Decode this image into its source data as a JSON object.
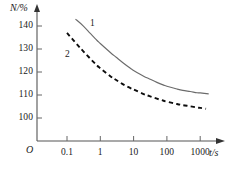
{
  "chart_data": {
    "type": "line",
    "title": "",
    "subtitle": "",
    "xlabel": "t/s",
    "ylabel": "N/%",
    "origin_label": "O",
    "xscale": "log",
    "yscale": "linear",
    "grid": false,
    "legend": "inline-curve-labels",
    "xtick_labels": [
      "0.1",
      "1",
      "10",
      "100",
      "1000"
    ],
    "xtick_values": [
      0.1,
      1,
      10,
      100,
      1000
    ],
    "ytick_labels": [
      "100",
      "110",
      "120",
      "130",
      "140"
    ],
    "ytick_values": [
      100,
      110,
      120,
      130,
      140
    ],
    "xlim": [
      0.1,
      1000
    ],
    "ylim": [
      96,
      144
    ],
    "series": [
      {
        "name": "1",
        "label": "1",
        "style": "solid",
        "color": "#6b6b6b",
        "x": [
          0.18,
          0.3,
          0.5,
          0.8,
          1,
          2,
          3,
          5,
          8,
          10,
          20,
          30,
          50,
          80,
          100,
          200,
          300,
          500,
          800,
          1000,
          1800
        ],
        "y": [
          143.0,
          140.2,
          136.8,
          133.7,
          132.4,
          128.5,
          126.4,
          123.8,
          121.6,
          120.7,
          118.2,
          117.0,
          115.5,
          114.3,
          113.8,
          112.6,
          112.0,
          111.5,
          111.0,
          110.9,
          110.5
        ]
      },
      {
        "name": "2",
        "label": "2",
        "style": "dashed",
        "color": "#0d0d0d",
        "x": [
          0.1,
          0.2,
          0.3,
          0.5,
          0.8,
          1,
          2,
          3,
          5,
          8,
          10,
          20,
          30,
          50,
          80,
          100,
          200,
          300,
          500,
          800,
          1000,
          1500
        ],
        "y": [
          137.0,
          132.0,
          129.2,
          125.8,
          122.8,
          121.6,
          118.2,
          116.5,
          114.5,
          113.0,
          112.4,
          110.4,
          109.5,
          108.4,
          107.5,
          107.1,
          106.1,
          105.6,
          105.1,
          104.6,
          104.4,
          104.0
        ]
      }
    ],
    "curve_labels": [
      {
        "text": "1",
        "x_px": 90,
        "y_px": 19
      },
      {
        "text": "2",
        "x_px": 65,
        "y_px": 50
      }
    ]
  }
}
